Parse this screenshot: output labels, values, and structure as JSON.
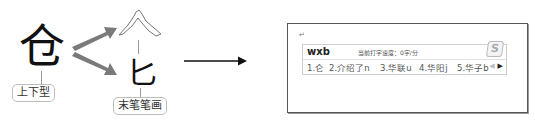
{
  "left_diagram": {
    "main_char": "仓",
    "structure_label": "上下型",
    "top_component": "人",
    "bottom_component": "匕",
    "last_stroke_label": "末笔笔画"
  },
  "arrow_glyph": "→",
  "ime_window": {
    "cursor_mark": "↵",
    "input_code": "wxb",
    "speed_text": "当前打字速度：0字/分",
    "logo": "S",
    "candidates": [
      {
        "index": "1.",
        "text": "仑"
      },
      {
        "index": "2.",
        "text": "介绍了n"
      },
      {
        "index": "3.",
        "text": "华联u"
      },
      {
        "index": "4.",
        "text": "华阳j"
      },
      {
        "index": "5.",
        "text": "华子b"
      }
    ],
    "prev_page": "◀",
    "next_page": "▶"
  }
}
